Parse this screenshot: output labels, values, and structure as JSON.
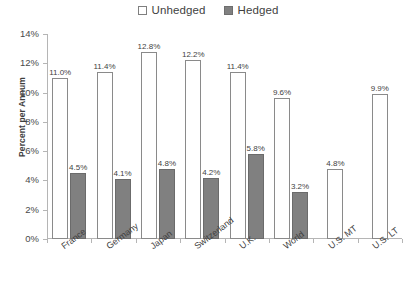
{
  "chart_data": {
    "type": "bar",
    "title": "",
    "xlabel": "",
    "ylabel": "Percent per Annum",
    "ylim": [
      0,
      14
    ],
    "ytick_labels": [
      "0%",
      "2%",
      "4%",
      "6%",
      "8%",
      "10%",
      "12%",
      "14%"
    ],
    "ytick_values": [
      0,
      2,
      4,
      6,
      8,
      10,
      12,
      14
    ],
    "grid": false,
    "legend_position": "top-center",
    "categories": [
      "France",
      "Germany",
      "Japan",
      "Switzerland",
      "U.K.",
      "World",
      "U.S. MT",
      "U.S. LT"
    ],
    "series": [
      {
        "name": "Unhedged",
        "color": "#ffffff",
        "border_color": "#8a8a8a",
        "values": [
          11.0,
          11.4,
          12.8,
          12.2,
          11.4,
          9.6,
          4.8,
          9.9
        ],
        "labels": [
          "11.0%",
          "11.4%",
          "12.8%",
          "12.2%",
          "11.4%",
          "9.6%",
          "4.8%",
          "9.9%"
        ]
      },
      {
        "name": "Hedged",
        "color": "#808080",
        "border_color": "#6b6b6b",
        "values": [
          4.5,
          4.1,
          4.8,
          4.2,
          5.8,
          3.2,
          null,
          null
        ],
        "labels": [
          "4.5%",
          "4.1%",
          "4.8%",
          "4.2%",
          "5.8%",
          "3.2%",
          "",
          ""
        ]
      }
    ]
  },
  "legend": {
    "items": [
      {
        "label": "Unhedged",
        "swatch": "unhedged"
      },
      {
        "label": "Hedged",
        "swatch": "hedged"
      }
    ]
  },
  "axis": {
    "y_title": "Percent per Annum"
  }
}
